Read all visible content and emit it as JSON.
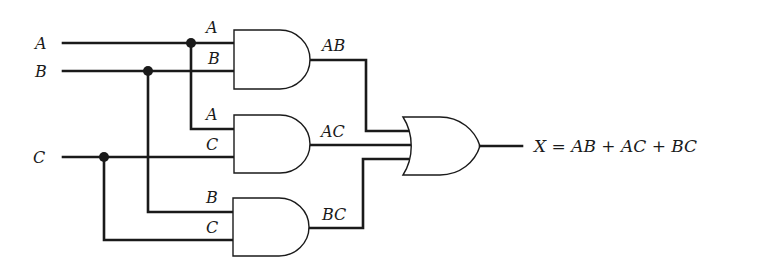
{
  "diagram": {
    "type": "logic-circuit",
    "inputs": {
      "a": "A",
      "b": "B",
      "c": "C"
    },
    "gates": {
      "and1": {
        "type": "AND",
        "in1": "A",
        "in2": "B",
        "out": "AB"
      },
      "and2": {
        "type": "AND",
        "in1": "A",
        "in2": "C",
        "out": "AC"
      },
      "and3": {
        "type": "AND",
        "in1": "B",
        "in2": "C",
        "out": "BC"
      },
      "or1": {
        "type": "OR",
        "inputs": [
          "AB",
          "AC",
          "BC"
        ]
      }
    },
    "output_equation": "X = AB + AC + BC",
    "colors": {
      "ink": "#1a1a1a",
      "background": "#ffffff"
    }
  }
}
